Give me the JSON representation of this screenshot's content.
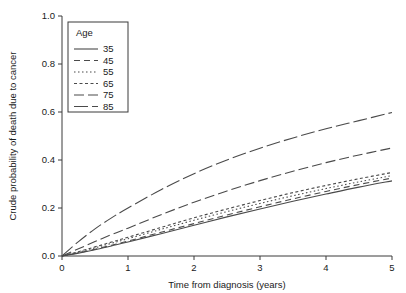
{
  "chart_data": {
    "type": "line",
    "title": "",
    "xlabel": "Time from diagnosis (years)",
    "ylabel": "Crude probability of death due to cancer",
    "xlim": [
      0,
      5
    ],
    "ylim": [
      0,
      1.0
    ],
    "xticks": [
      "0",
      "1",
      "2",
      "3",
      "4",
      "5"
    ],
    "yticks": [
      "0.0",
      "0.2",
      "0.4",
      "0.6",
      "0.8",
      "1.0"
    ],
    "grid": false,
    "legend": {
      "title": "Age",
      "position": "top-left-inside",
      "entries": [
        {
          "label": "35",
          "dash": "none"
        },
        {
          "label": "45",
          "dash": "6,4"
        },
        {
          "label": "55",
          "dash": "1.5,2.5"
        },
        {
          "label": "65",
          "dash": "3,2.5"
        },
        {
          "label": "75",
          "dash": "10,4"
        },
        {
          "label": "85",
          "dash": "14,4"
        }
      ]
    },
    "x": [
      0,
      0.25,
      0.5,
      0.75,
      1,
      1.5,
      2,
      2.5,
      3,
      3.5,
      4,
      4.5,
      5
    ],
    "series": [
      {
        "name": "35",
        "label": "35",
        "dash": "none",
        "values": [
          0.0,
          0.012,
          0.026,
          0.042,
          0.058,
          0.093,
          0.128,
          0.163,
          0.196,
          0.228,
          0.258,
          0.287,
          0.313
        ]
      },
      {
        "name": "45",
        "label": "45",
        "dash": "6,4",
        "values": [
          0.0,
          0.013,
          0.028,
          0.045,
          0.062,
          0.099,
          0.135,
          0.171,
          0.205,
          0.238,
          0.269,
          0.298,
          0.325
        ]
      },
      {
        "name": "55",
        "label": "55",
        "dash": "1.5,2.5",
        "values": [
          0.0,
          0.016,
          0.034,
          0.053,
          0.072,
          0.111,
          0.149,
          0.185,
          0.219,
          0.251,
          0.281,
          0.309,
          0.335
        ]
      },
      {
        "name": "65",
        "label": "65",
        "dash": "3,2.5",
        "values": [
          0.0,
          0.018,
          0.038,
          0.058,
          0.078,
          0.119,
          0.159,
          0.196,
          0.231,
          0.264,
          0.294,
          0.322,
          0.348
        ]
      },
      {
        "name": "75",
        "label": "75",
        "dash": "10,4",
        "values": [
          0.0,
          0.03,
          0.06,
          0.089,
          0.116,
          0.172,
          0.224,
          0.271,
          0.314,
          0.353,
          0.389,
          0.421,
          0.45
        ]
      },
      {
        "name": "85",
        "label": "85",
        "dash": "14,4",
        "values": [
          0.0,
          0.06,
          0.113,
          0.159,
          0.2,
          0.276,
          0.343,
          0.4,
          0.449,
          0.492,
          0.53,
          0.564,
          0.598
        ]
      }
    ]
  },
  "colors": {
    "line": "#4a4a4a",
    "axis": "#3a3a3a",
    "text": "#1a1a1a",
    "background": "#ffffff"
  }
}
